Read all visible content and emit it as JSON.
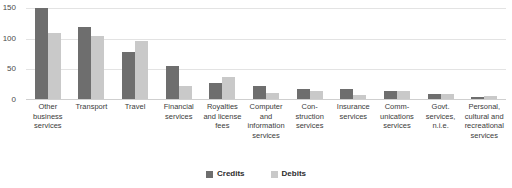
{
  "chart_data": {
    "type": "bar",
    "title": "",
    "xlabel": "",
    "ylabel": "",
    "ylim": [
      0,
      150
    ],
    "yticks": [
      0,
      50,
      100,
      150
    ],
    "grid": true,
    "legend_position": "bottom-center",
    "categories": [
      "Other business services",
      "Transport",
      "Travel",
      "Financial services",
      "Royalties and license fees",
      "Computer and information services",
      "Con-struction services",
      "Insurance services",
      "Comm-unications services",
      "Govt. services, n.i.e.",
      "Personal, cultural and recreational services"
    ],
    "series": [
      {
        "name": "Credits",
        "color": "#6e6e6e",
        "values": [
          148,
          118,
          76,
          54,
          26,
          22,
          17,
          16,
          13,
          8,
          4
        ]
      },
      {
        "name": "Debits",
        "color": "#c9c9c9",
        "values": [
          107,
          102,
          94,
          21,
          36,
          9,
          13,
          7,
          13,
          8,
          5
        ]
      }
    ]
  },
  "legend": {
    "items": [
      {
        "label": "Credits"
      },
      {
        "label": "Debits"
      }
    ]
  }
}
